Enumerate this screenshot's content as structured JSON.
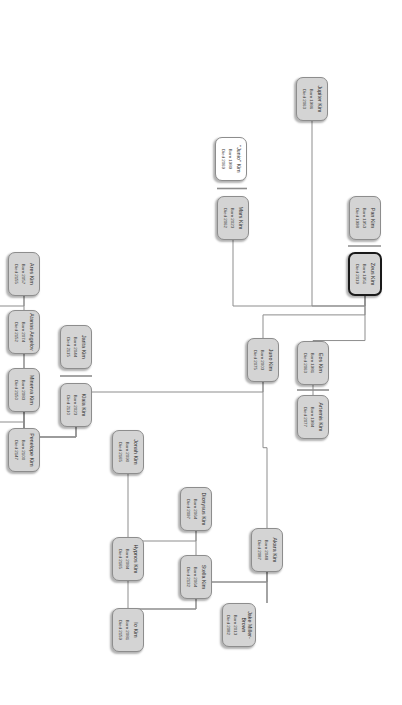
{
  "diagram": {
    "type": "family-tree",
    "orientation": "rotated-90",
    "colors": {
      "node_fill": "#d4d4d4",
      "node_fill_alt": "#ffffff",
      "node_border": "#8d8d8d",
      "root_border": "#1a1a1a",
      "edge": "#8d8d8d",
      "text": "#2b2b2b",
      "background": "#ffffff"
    },
    "labels": {
      "born_prefix": "Born",
      "died_prefix": "Died"
    },
    "nodes": [
      {
        "id": "zeus",
        "name": "Zeus Kim",
        "born": "Born 1951",
        "died": "Died 2019",
        "style": "root",
        "x": 252,
        "y": 20,
        "w": 44,
        "h": 34
      },
      {
        "id": "pan",
        "name": "Pan Kim",
        "born": "Born 1953",
        "died": "Died 1998",
        "style": "fill",
        "x": 196,
        "y": 21,
        "w": 44,
        "h": 32
      },
      {
        "id": "artemis",
        "name": "Artemis Kim",
        "born": "Born 1984",
        "died": "Died 2077",
        "style": "fill",
        "x": 395,
        "y": 73,
        "w": 44,
        "h": 32
      },
      {
        "id": "eos",
        "name": "Eos Kim",
        "born": "Born 1981",
        "died": "Died 2063",
        "style": "fill",
        "x": 341,
        "y": 73,
        "w": 44,
        "h": 32
      },
      {
        "id": "juno",
        "name": "Juno Kim",
        "born": "Born 2003",
        "died": "Died 2075",
        "style": "fill",
        "x": 338,
        "y": 123,
        "w": 44,
        "h": 32
      },
      {
        "id": "akara",
        "name": "Akara Kim",
        "born": "Born 2048",
        "died": "Died 2087",
        "style": "fill",
        "x": 528,
        "y": 119,
        "w": 44,
        "h": 32
      },
      {
        "id": "jake",
        "name": "Jake Miller-\nBrown",
        "born": "Born 2013",
        "died": "Died 2082",
        "style": "fill",
        "x": 603,
        "y": 146,
        "w": 44,
        "h": 34
      },
      {
        "id": "stella",
        "name": "Stella Kim",
        "born": "Born 2064",
        "died": "Died 2132",
        "style": "fill",
        "x": 555,
        "y": 190,
        "w": 44,
        "h": 32
      },
      {
        "id": "io",
        "name": "Io Kim",
        "born": "Born 2081",
        "died": "Died 2159",
        "style": "fill",
        "x": 608,
        "y": 258,
        "w": 44,
        "h": 32
      },
      {
        "id": "hypnos",
        "name": "Hypnos Kim",
        "born": "Born 2084",
        "died": "Died 2165",
        "style": "fill",
        "x": 537,
        "y": 258,
        "w": 44,
        "h": 32
      },
      {
        "id": "dionysus",
        "name": "Dionysus Kim",
        "born": "Born 2064",
        "died": "Died 2097",
        "style": "fill",
        "x": 487,
        "y": 190,
        "w": 44,
        "h": 32
      },
      {
        "id": "jonah",
        "name": "Jonah Kim",
        "born": "Born 2090",
        "died": "Died 2165",
        "style": "fill",
        "x": 430,
        "y": 258,
        "w": 44,
        "h": 32
      },
      {
        "id": "klaia",
        "name": "Klaia Kim",
        "born": "Born 2023",
        "died": "Died 2110",
        "style": "fill",
        "x": 383,
        "y": 310,
        "w": 44,
        "h": 32
      },
      {
        "id": "jarita",
        "name": "Jarita Kim",
        "born": "Born 2044",
        "died": "Died 2115",
        "style": "fill",
        "x": 325,
        "y": 310,
        "w": 44,
        "h": 32
      },
      {
        "id": "penelope",
        "name": "Penelope Kim",
        "born": "Born 2100",
        "died": "Died 2147",
        "style": "fill",
        "x": 428,
        "y": 362,
        "w": 44,
        "h": 32
      },
      {
        "id": "minerva",
        "name": "Minerva Kim",
        "born": "Born 2083",
        "died": "Died 2150",
        "style": "fill",
        "x": 368,
        "y": 362,
        "w": 44,
        "h": 32
      },
      {
        "id": "hera",
        "name": "Hera Kim",
        "born": "Born 3134",
        "died": "Died 3212",
        "style": "fill",
        "x": 399,
        "y": 431,
        "w": 44,
        "h": 32
      },
      {
        "id": "atanas",
        "name": "Atanas Angelov",
        "born": "Born 2074",
        "died": "Died 2152",
        "style": "fill",
        "x": 310,
        "y": 362,
        "w": 44,
        "h": 32
      },
      {
        "id": "ares",
        "name": "Ares Kim",
        "born": "Born 2057",
        "died": "Died 2155",
        "style": "fill",
        "x": 252,
        "y": 362,
        "w": 44,
        "h": 32
      },
      {
        "id": "pegasus",
        "name": "Pegasus Kim",
        "born": "Born 2102",
        "died": "Died 2176",
        "style": "white",
        "x": 252,
        "y": 431,
        "w": 44,
        "h": 32
      },
      {
        "id": "mars",
        "name": "Mars Kim",
        "born": "Born 2023",
        "died": "Died 2062",
        "style": "fill",
        "x": 196,
        "y": 153,
        "w": 44,
        "h": 32
      },
      {
        "id": "junio",
        "name": "\"Junio\" Kim",
        "born": "Born 1989",
        "died": "Died 2069",
        "style": "white",
        "x": 137,
        "y": 155,
        "w": 44,
        "h": 32
      },
      {
        "id": "jupiter",
        "name": "Jupiter Kim",
        "born": "Born 1986",
        "died": "Died 2063",
        "style": "fill",
        "x": 77,
        "y": 74,
        "w": 44,
        "h": 32
      }
    ],
    "edges": [
      {
        "from": "zeus",
        "to": "pan",
        "kind": "partner"
      },
      {
        "from": "zeus",
        "to": "artemis",
        "kind": "child"
      },
      {
        "from": "zeus",
        "to": "juno",
        "kind": "child"
      },
      {
        "from": "zeus",
        "to": "mars",
        "kind": "child"
      },
      {
        "from": "zeus",
        "to": "jupiter",
        "kind": "child"
      },
      {
        "from": "artemis",
        "to": "eos",
        "kind": "partner"
      },
      {
        "from": "juno",
        "to": "akara",
        "kind": "child"
      },
      {
        "from": "juno",
        "to": "klaia",
        "kind": "child"
      },
      {
        "from": "akara",
        "to": "jake",
        "kind": "partner"
      },
      {
        "from": "akara",
        "to": "stella",
        "kind": "child"
      },
      {
        "from": "akara",
        "to": "dionysus",
        "kind": "child"
      },
      {
        "from": "stella",
        "to": "io",
        "kind": "child"
      },
      {
        "from": "stella",
        "to": "hypnos",
        "kind": "child"
      },
      {
        "from": "dionysus",
        "to": "jonah",
        "kind": "child"
      },
      {
        "from": "klaia",
        "to": "jarita",
        "kind": "partner"
      },
      {
        "from": "klaia",
        "to": "minerva",
        "kind": "child"
      },
      {
        "from": "klaia",
        "to": "atanas",
        "kind": "child"
      },
      {
        "from": "klaia",
        "to": "ares",
        "kind": "child"
      },
      {
        "from": "minerva",
        "to": "penelope",
        "kind": "partner"
      },
      {
        "from": "minerva",
        "to": "hera",
        "kind": "child"
      },
      {
        "from": "ares",
        "to": "pegasus",
        "kind": "child"
      },
      {
        "from": "mars",
        "to": "junio",
        "kind": "partner"
      }
    ]
  }
}
